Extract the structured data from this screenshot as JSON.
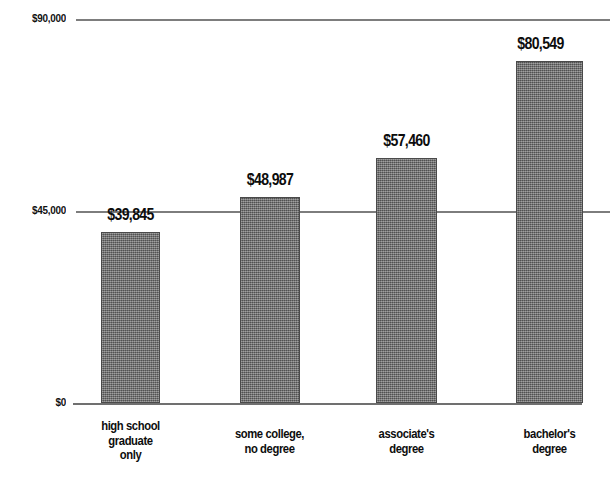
{
  "chart_data": {
    "type": "bar",
    "title": "",
    "subtitle": "",
    "xlabel": "",
    "ylabel": "",
    "categories": [
      "high school\ngraduate\nonly",
      "some college,\nno degree",
      "associate's\ndegree",
      "bachelor's\ndegree"
    ],
    "values": [
      39845,
      48987,
      57460,
      80549
    ],
    "value_labels": [
      "$39,845",
      "$48,987",
      "$57,460",
      "$80,549"
    ],
    "ylim": [
      0,
      90000
    ],
    "yticks": [
      0,
      45000,
      90000
    ],
    "ytick_labels": [
      "$0",
      "$45,000",
      "$90,000"
    ],
    "grid": true,
    "legend": false,
    "bar_color": "#6f6f6f",
    "bar_edge_color": "#4a4a4a",
    "gridline_color": "#7d7d7d",
    "text_color": "#0d0d0d",
    "background": "#ffffff"
  },
  "axis": {
    "ticks": [
      {
        "label": "$90,000",
        "value": 90000,
        "y": 19
      },
      {
        "label": "$45,000",
        "value": 45000,
        "y": 211
      },
      {
        "label": "$0",
        "value": 0,
        "y": 403
      }
    ]
  },
  "bars": [
    {
      "category": "high school\ngraduate\nonly",
      "value": 39845,
      "value_label": "$39,845",
      "x": 101,
      "width": 59,
      "top": 232,
      "height": 171,
      "label_x": 71,
      "label_y": 206,
      "cat_x": 58,
      "cat_y": 419,
      "cat_width": 145
    },
    {
      "category": "some college,\nno degree",
      "value": 48987,
      "value_label": "$48,987",
      "x": 240,
      "width": 60,
      "top": 197,
      "height": 206,
      "label_x": 210,
      "label_y": 171,
      "cat_x": 197,
      "cat_y": 427,
      "cat_width": 145
    },
    {
      "category": "associate's\ndegree",
      "value": 57460,
      "value_label": "$57,460",
      "x": 376,
      "width": 61,
      "top": 158,
      "height": 245,
      "label_x": 346,
      "label_y": 132,
      "cat_x": 334,
      "cat_y": 427,
      "cat_width": 145
    },
    {
      "category": "bachelor's\ndegree",
      "value": 80549,
      "value_label": "$80,549",
      "x": 516,
      "width": 67,
      "top": 61,
      "height": 342,
      "label_x": 477,
      "label_y": 35,
      "cat_x": 477,
      "cat_y": 427,
      "cat_width": 145
    }
  ],
  "gridlines": [
    {
      "name": "gridline-90000",
      "y": 19,
      "x": 76,
      "width": 534
    },
    {
      "name": "gridline-45000",
      "y": 211,
      "x": 76,
      "width": 534
    },
    {
      "name": "axis-baseline",
      "y": 403,
      "x": 73,
      "width": 509
    }
  ]
}
